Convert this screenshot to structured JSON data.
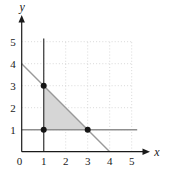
{
  "figure": {
    "width": 169,
    "height": 172,
    "background": "#ffffff"
  },
  "chart_data": {
    "type": "line",
    "xlabel": "x",
    "ylabel": "y",
    "xlim": [
      0,
      5.8
    ],
    "ylim": [
      0,
      6.2
    ],
    "x_tick_labels": [
      "0",
      "1",
      "2",
      "3",
      "4",
      "5"
    ],
    "y_tick_labels": [
      "1",
      "2",
      "3",
      "4",
      "5"
    ],
    "grid": {
      "show": true,
      "style": "dotted",
      "color": "#cfcfcf",
      "min": 0,
      "max": 5
    },
    "axes": {
      "color": "#1a1a1a",
      "width": 1.2
    },
    "label_color": "#1a1a1a",
    "tick_font_size": 11,
    "axis_label_font_size": 12,
    "lines": [
      {
        "name": "line-x-equals-1",
        "points": [
          [
            1,
            0
          ],
          [
            1,
            5.15
          ]
        ],
        "color": "#4f4f4f",
        "width": 1.4
      },
      {
        "name": "line-y-equals-1",
        "points": [
          [
            0,
            1
          ],
          [
            5.25,
            1
          ]
        ],
        "color": "#8f8f8f",
        "width": 1.4
      },
      {
        "name": "line-x-plus-y-equals-4",
        "points": [
          [
            0,
            4
          ],
          [
            4,
            0
          ]
        ],
        "color": "#9a9a9a",
        "width": 1.4
      }
    ],
    "region": {
      "vertices": [
        [
          1,
          1
        ],
        [
          1,
          3
        ],
        [
          3,
          1
        ]
      ],
      "fill": "#d6d6d6"
    },
    "points": {
      "coords": [
        [
          1,
          3
        ],
        [
          1,
          1
        ],
        [
          3,
          1
        ]
      ],
      "color": "#151515",
      "radius": 3
    }
  }
}
